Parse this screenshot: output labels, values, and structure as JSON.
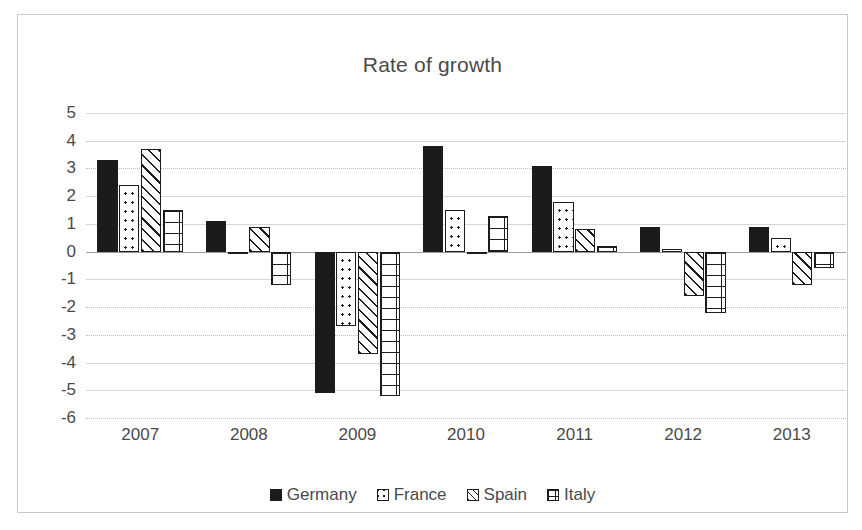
{
  "chart_data": {
    "type": "bar",
    "title": "Rate of growth",
    "xlabel": "",
    "ylabel": "",
    "categories": [
      "2007",
      "2008",
      "2009",
      "2010",
      "2011",
      "2012",
      "2013"
    ],
    "series": [
      {
        "name": "Germany",
        "pattern": "solid-black",
        "color": "#1b1b1b",
        "values": [
          3.3,
          1.1,
          -5.1,
          3.8,
          3.1,
          0.9,
          0.9
        ]
      },
      {
        "name": "France",
        "pattern": "dotted",
        "color": "#ffffff",
        "values": [
          2.4,
          -0.1,
          -2.7,
          1.5,
          1.8,
          0.1,
          0.5
        ]
      },
      {
        "name": "Spain",
        "pattern": "diagonal-hatch",
        "color": "#ffffff",
        "values": [
          3.7,
          0.9,
          -3.7,
          -0.1,
          0.8,
          -1.6,
          -1.2
        ]
      },
      {
        "name": "Italy",
        "pattern": "brick",
        "color": "#ffffff",
        "values": [
          1.5,
          -1.2,
          -5.2,
          1.3,
          0.2,
          -2.2,
          -0.6
        ]
      }
    ],
    "ylim": [
      -6,
      5
    ],
    "yticks": [
      5,
      4,
      3,
      2,
      1,
      0,
      -1,
      -2,
      -3,
      -4,
      -5,
      -6
    ],
    "ytick_labels": [
      "5",
      "4",
      "3",
      "2",
      "1",
      "0",
      "-1",
      "-2",
      "-3",
      "-4",
      "-5",
      "-6"
    ],
    "grid": true,
    "legend_position": "bottom",
    "axis_color": "#d6d6d6",
    "text_color": "#4a4a4a"
  }
}
